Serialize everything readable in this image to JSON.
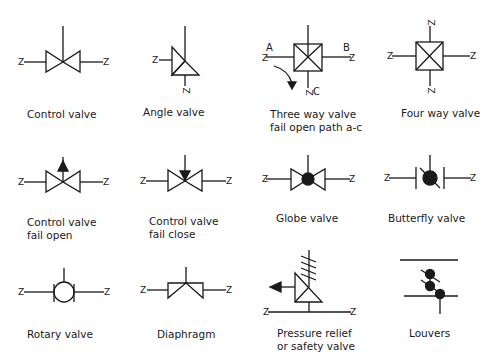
{
  "symbols": [
    {
      "id": "control-valve",
      "label_lines": [
        "Control valve"
      ]
    },
    {
      "id": "angle-valve",
      "label_lines": [
        "Angle valve"
      ]
    },
    {
      "id": "three-way-valve",
      "label_lines": [
        "Three way valve",
        "fail open path a-c"
      ],
      "ports": {
        "a": "A",
        "b": "B",
        "c": "C"
      }
    },
    {
      "id": "four-way-valve",
      "label_lines": [
        "Four way valve"
      ]
    },
    {
      "id": "control-valve-fail-open",
      "label_lines": [
        "Control valve",
        "fail open"
      ]
    },
    {
      "id": "control-valve-fail-close",
      "label_lines": [
        "Control valve",
        "fail close"
      ]
    },
    {
      "id": "globe-valve",
      "label_lines": [
        "Globe valve"
      ]
    },
    {
      "id": "butterfly-valve",
      "label_lines": [
        "Butterfly valve"
      ]
    },
    {
      "id": "rotary-valve",
      "label_lines": [
        "Rotary valve"
      ]
    },
    {
      "id": "diaphragm",
      "label_lines": [
        "Diaphragm"
      ]
    },
    {
      "id": "pressure-relief-valve",
      "label_lines": [
        "Pressure relief",
        "or safety valve"
      ]
    },
    {
      "id": "louvers",
      "label_lines": [
        "Louvers"
      ]
    }
  ],
  "pipe_end_mark": "Z",
  "colors": {
    "stroke": "#1a1a1a",
    "background": "#ffffff"
  }
}
